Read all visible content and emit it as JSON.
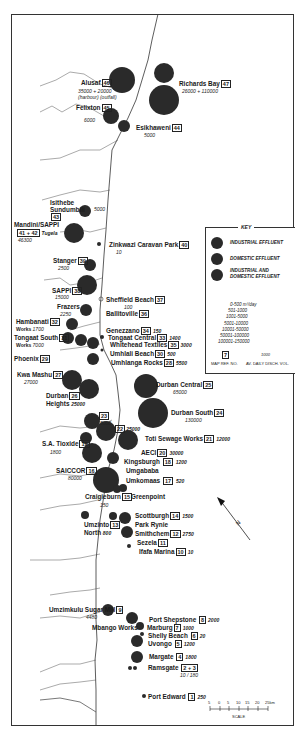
{
  "map": {
    "title": "Effluent discharge sites along the KwaZulu-Natal coast",
    "north_label": "N",
    "scale": {
      "label": "SCALE",
      "ticks": [
        "5",
        "0",
        "5",
        "10",
        "15",
        "20",
        "25km"
      ]
    },
    "key": {
      "title": "KEY",
      "categories": [
        {
          "label": "INDUSTRIAL EFFLUENT",
          "color": "#2a2a2a"
        },
        {
          "label": "DOMESTIC EFFLUENT",
          "color": "#2a2a2a"
        },
        {
          "label": "INDUSTRIAL AND DOMESTIC EFFLUENT",
          "color": "#2a2a2a"
        }
      ],
      "ranges": [
        "0-500 m³/day",
        "501-1000",
        "1001-5000",
        "5001-10000",
        "10001-50000",
        "50001-100000",
        "100001-150000"
      ],
      "example_ref": "7",
      "example_vol": "1000",
      "ref_caption": "MAP REF. NO.",
      "vol_caption": "AV. DAILY DISCH. VOL."
    },
    "sites": [
      {
        "name": "Richards Bay",
        "ref": "47",
        "volume": "26000 + 110000"
      },
      {
        "name": "Alusaf",
        "ref": "46",
        "volume": "35000 + 20000",
        "note": "(harbour) (outfall)"
      },
      {
        "name": "Felixton",
        "ref": "45",
        "volume": "6000"
      },
      {
        "name": "Esikhaweni",
        "ref": "44",
        "volume": "5000"
      },
      {
        "name": "Isithebe Sundumbili",
        "ref": "43",
        "volume": "5000"
      },
      {
        "name": "Mandini/SAPPI",
        "ref": "41 + 42",
        "volume": "46300",
        "note": "Tugela"
      },
      {
        "name": "Zinkwazi Caravan Park",
        "ref": "40",
        "volume": "10"
      },
      {
        "name": "Stanger",
        "ref": "39",
        "volume": "2500"
      },
      {
        "name": "SAPPI",
        "ref": "38",
        "volume": "15000"
      },
      {
        "name": "Sheffield Beach",
        "ref": "37",
        "volume": "100"
      },
      {
        "name": "Ballitoville",
        "ref": "36",
        "volume": ""
      },
      {
        "name": "Frazers",
        "ref": "",
        "volume": "2250"
      },
      {
        "name": "Hambanati Works",
        "ref": "32",
        "volume": "1700"
      },
      {
        "name": "Genezzano",
        "ref": "34",
        "volume": "150"
      },
      {
        "name": "Tongaat Central",
        "ref": "33",
        "volume": "1400"
      },
      {
        "name": "Tongaat South Works",
        "ref": "31",
        "volume": "7000"
      },
      {
        "name": "Whitehead Textiles",
        "ref": "35",
        "volume": "3000"
      },
      {
        "name": "Umhlali Beach",
        "ref": "30",
        "volume": "500"
      },
      {
        "name": "Phoenix",
        "ref": "29",
        "volume": ""
      },
      {
        "name": "Umhlanga Rocks",
        "ref": "28",
        "volume": "5500"
      },
      {
        "name": "Kwa Mashu",
        "ref": "27",
        "volume": "27000"
      },
      {
        "name": "Durban Central",
        "ref": "25",
        "volume": "65000"
      },
      {
        "name": "Durban Heights",
        "ref": "26",
        "volume": "25000"
      },
      {
        "name": "Durban South",
        "ref": "24",
        "volume": "130000"
      },
      {
        "name": "",
        "ref": "23",
        "volume": "5000"
      },
      {
        "name": "",
        "ref": "22",
        "volume": "25000"
      },
      {
        "name": "Toti Sewage Works",
        "ref": "21",
        "volume": "12000"
      },
      {
        "name": "S.A. Tioxide",
        "ref": "19",
        "volume": "1800"
      },
      {
        "name": "AECI",
        "ref": "20",
        "volume": "30000"
      },
      {
        "name": "Kingsburgh",
        "ref": "18",
        "volume": "1200"
      },
      {
        "name": "SAICCOR",
        "ref": "16",
        "volume": "80000"
      },
      {
        "name": "Umgababa",
        "ref": "",
        "volume": ""
      },
      {
        "name": "Umkomaas",
        "ref": "17",
        "volume": "520"
      },
      {
        "name": "Craigieburn",
        "ref": "15",
        "volume": "150"
      },
      {
        "name": "Greenpoint",
        "ref": "",
        "volume": ""
      },
      {
        "name": "Scottburgh",
        "ref": "14",
        "volume": "1500"
      },
      {
        "name": "Umzinto North",
        "ref": "13",
        "volume": "800"
      },
      {
        "name": "Park Rynie",
        "ref": "",
        "volume": ""
      },
      {
        "name": "Smithchem",
        "ref": "12",
        "volume": "2750"
      },
      {
        "name": "Sezela",
        "ref": "11",
        "volume": ""
      },
      {
        "name": "Ifafa Marina",
        "ref": "10",
        "volume": "10"
      },
      {
        "name": "Umzimkulu Sugar Mill",
        "ref": "9",
        "volume": "4480"
      },
      {
        "name": "Port Shepstone",
        "ref": "8",
        "volume": "2000"
      },
      {
        "name": "Mbango Works",
        "ref": "",
        "volume": ""
      },
      {
        "name": "Marburg",
        "ref": "7",
        "volume": "1000"
      },
      {
        "name": "Shelly Beach",
        "ref": "6",
        "volume": "20"
      },
      {
        "name": "Uvongo",
        "ref": "5",
        "volume": "1200"
      },
      {
        "name": "Margate",
        "ref": "4",
        "volume": "1800"
      },
      {
        "name": "Ramsgate",
        "ref": "2 + 3",
        "volume": "10 / 180"
      },
      {
        "name": "Port Edward",
        "ref": "1",
        "volume": "250"
      }
    ]
  }
}
